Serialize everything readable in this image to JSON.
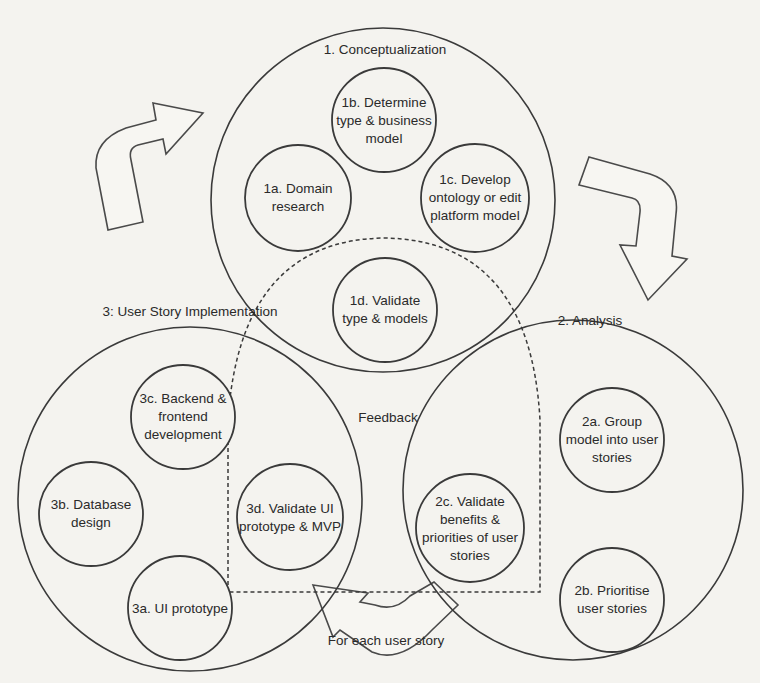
{
  "diagram": {
    "phases": [
      {
        "id": "1",
        "title": "1. Conceptualization",
        "steps": [
          {
            "id": "1a",
            "lines": [
              "1a. Domain",
              "research"
            ]
          },
          {
            "id": "1b",
            "lines": [
              "1b. Determine",
              "type & business",
              "model"
            ]
          },
          {
            "id": "1c",
            "lines": [
              "1c. Develop",
              "ontology or edit",
              "platform model"
            ]
          },
          {
            "id": "1d",
            "lines": [
              "1d. Validate",
              "type & models"
            ]
          }
        ]
      },
      {
        "id": "2",
        "title": "2. Analysis",
        "steps": [
          {
            "id": "2a",
            "lines": [
              "2a. Group",
              "model into user",
              "stories"
            ]
          },
          {
            "id": "2b",
            "lines": [
              "2b. Prioritise",
              "user stories"
            ]
          },
          {
            "id": "2c",
            "lines": [
              "2c. Validate",
              "benefits &",
              "priorities of user",
              "stories"
            ]
          }
        ]
      },
      {
        "id": "3",
        "title": "3: User Story Implementation",
        "steps": [
          {
            "id": "3a",
            "lines": [
              "3a. UI prototype"
            ]
          },
          {
            "id": "3b",
            "lines": [
              "3b. Database",
              "design"
            ]
          },
          {
            "id": "3c",
            "lines": [
              "3c. Backend &",
              "frontend",
              "development"
            ]
          },
          {
            "id": "3d",
            "lines": [
              "3d. Validate UI",
              "prototype & MVP"
            ]
          }
        ]
      }
    ],
    "feedback_label": "Feedback",
    "loop_label": "For each user story",
    "arrows": [
      "phase3-to-phase1",
      "phase1-to-phase2",
      "phase2-to-phase3"
    ]
  },
  "colors": {
    "background": "#f4f3ef",
    "stroke": "#3a3a3a",
    "text": "#2a2a2a"
  }
}
